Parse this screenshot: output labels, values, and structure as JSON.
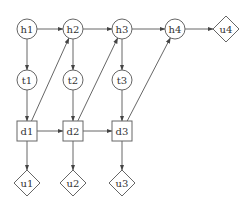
{
  "diagram": {
    "type": "dynamic-influence-diagram",
    "nodes": [
      {
        "id": "h1",
        "label": "h1",
        "shape": "circle",
        "x": 27,
        "y": 29
      },
      {
        "id": "h2",
        "label": "h2",
        "shape": "circle",
        "x": 73,
        "y": 29
      },
      {
        "id": "h3",
        "label": "h3",
        "shape": "circle",
        "x": 122,
        "y": 29
      },
      {
        "id": "h4",
        "label": "h4",
        "shape": "circle",
        "x": 175,
        "y": 29
      },
      {
        "id": "u4",
        "label": "u4",
        "shape": "diamond",
        "x": 226,
        "y": 29
      },
      {
        "id": "t1",
        "label": "t1",
        "shape": "circle",
        "x": 27,
        "y": 80
      },
      {
        "id": "t2",
        "label": "t2",
        "shape": "circle",
        "x": 73,
        "y": 80
      },
      {
        "id": "t3",
        "label": "t3",
        "shape": "circle",
        "x": 122,
        "y": 80
      },
      {
        "id": "d1",
        "label": "d1",
        "shape": "square",
        "x": 27,
        "y": 131
      },
      {
        "id": "d2",
        "label": "d2",
        "shape": "square",
        "x": 73,
        "y": 131
      },
      {
        "id": "d3",
        "label": "d3",
        "shape": "square",
        "x": 122,
        "y": 131
      },
      {
        "id": "u1",
        "label": "u1",
        "shape": "diamond",
        "x": 27,
        "y": 183
      },
      {
        "id": "u2",
        "label": "u2",
        "shape": "diamond",
        "x": 73,
        "y": 183
      },
      {
        "id": "u3",
        "label": "u3",
        "shape": "diamond",
        "x": 122,
        "y": 183
      }
    ],
    "edges": [
      {
        "from": "h1",
        "to": "h2"
      },
      {
        "from": "h2",
        "to": "h3"
      },
      {
        "from": "h3",
        "to": "h4"
      },
      {
        "from": "h4",
        "to": "u4"
      },
      {
        "from": "h1",
        "to": "t1"
      },
      {
        "from": "h2",
        "to": "t2"
      },
      {
        "from": "h3",
        "to": "t3"
      },
      {
        "from": "t1",
        "to": "d1"
      },
      {
        "from": "t2",
        "to": "d2"
      },
      {
        "from": "t3",
        "to": "d3"
      },
      {
        "from": "d1",
        "to": "d2"
      },
      {
        "from": "d2",
        "to": "d3"
      },
      {
        "from": "d1",
        "to": "h2"
      },
      {
        "from": "d2",
        "to": "h3"
      },
      {
        "from": "d3",
        "to": "h4"
      },
      {
        "from": "d1",
        "to": "u1"
      },
      {
        "from": "d2",
        "to": "u2"
      },
      {
        "from": "d3",
        "to": "u3"
      }
    ]
  }
}
